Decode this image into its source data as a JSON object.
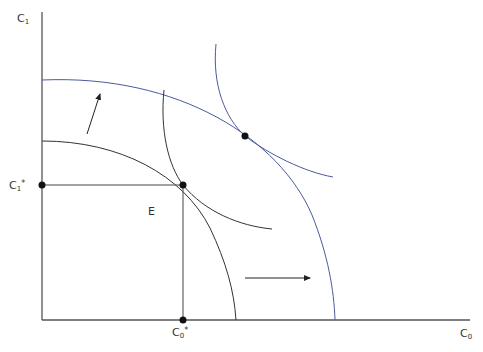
{
  "diagram": {
    "title": "",
    "axes": {
      "y_label": {
        "base": "C",
        "sub": "1"
      },
      "x_label": {
        "base": "C",
        "sub": "0"
      }
    },
    "points": {
      "E_label": "E",
      "c1_star": {
        "base": "C",
        "sub": "1",
        "sup": "*"
      },
      "c0_star": {
        "base": "C",
        "sub": "0",
        "sup": "*"
      }
    },
    "colors": {
      "axis": "#555555",
      "black_curve": "#333333",
      "blue_curve": "#4a5a9a",
      "dot": "#111111"
    },
    "elements": [
      "inner production possibility curve (black)",
      "outer production possibility curve (blue)",
      "lower indifference curve tangent at E (black)",
      "upper indifference curve tangent at new optimum (blue)",
      "arrow up-right indicating outward shift",
      "arrow right indicating outward shift"
    ]
  }
}
